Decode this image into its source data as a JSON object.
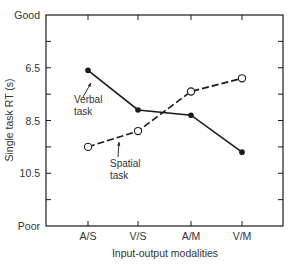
{
  "chart_data": {
    "type": "line",
    "title": "",
    "xlabel": "Input-output modalities",
    "ylabel": "Single task RT (s)",
    "categories": [
      "A/S",
      "V/S",
      "A/M",
      "V/M"
    ],
    "y_axis": {
      "inverted": true,
      "ylim": [
        4.5,
        12.5
      ],
      "top_label": "Good",
      "bottom_label": "Poor",
      "tick_labels": [
        "6.5",
        "8.5",
        "10.5"
      ],
      "tick_values": [
        6.5,
        8.5,
        10.5
      ],
      "minor_ticks": [
        5.5,
        7.5,
        9.5,
        11.5
      ]
    },
    "grid": false,
    "series": [
      {
        "name": "Verbal task",
        "label_lines": [
          "Verbal",
          "task"
        ],
        "line_style": "solid",
        "marker": "filled-circle",
        "values": [
          6.6,
          8.1,
          8.3,
          9.7
        ]
      },
      {
        "name": "Spatial task",
        "label_lines": [
          "Spatial",
          "task"
        ],
        "line_style": "dashed",
        "marker": "open-circle",
        "values": [
          9.5,
          8.9,
          7.4,
          6.9
        ]
      }
    ]
  },
  "colors": {
    "line": "#1a1a1a",
    "text": "#333333",
    "background": "#ffffff"
  }
}
